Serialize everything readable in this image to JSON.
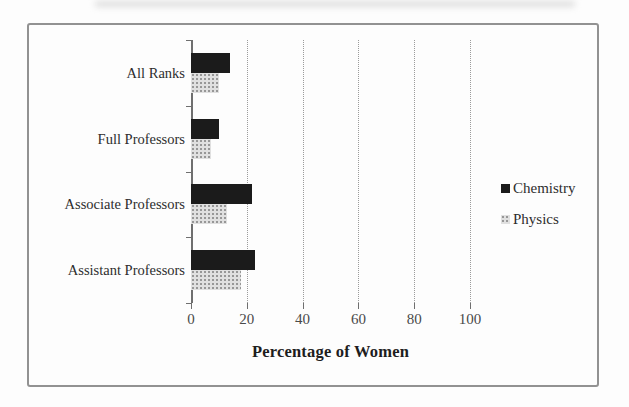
{
  "frame": {
    "border_color": "#929292"
  },
  "chart_data": {
    "type": "bar",
    "orientation": "horizontal",
    "title": "",
    "xlabel": "Percentage of Women",
    "ylabel": "",
    "categories": [
      "All Ranks",
      "Full Professors",
      "Associate Professors",
      "Assistant Professors"
    ],
    "series": [
      {
        "name": "Chemistry",
        "color": "#1b1b1b",
        "pattern": "solid",
        "values": [
          14,
          10,
          22,
          23
        ]
      },
      {
        "name": "Physics",
        "color": "#d9d9d9",
        "pattern": "halftone-dots",
        "values": [
          10,
          7,
          13,
          18
        ]
      }
    ],
    "xlim": [
      0,
      100
    ],
    "xticks": [
      0,
      20,
      40,
      60,
      80,
      100
    ],
    "grid": "vertical-dotted",
    "legend_position": "right",
    "bar_height_px": 20
  }
}
